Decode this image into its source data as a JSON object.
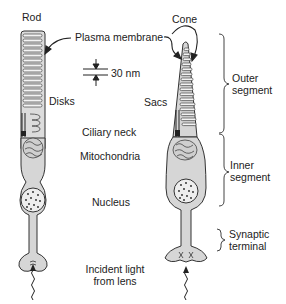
{
  "diagram": {
    "cells": {
      "rod": {
        "title": "Rod",
        "disks_label": "Disks"
      },
      "cone": {
        "title": "Cone",
        "sacs_label": "Sacs"
      }
    },
    "shared_labels": {
      "plasma_membrane": "Plasma membrane",
      "scale": "30 nm",
      "ciliary_neck": "Ciliary neck",
      "mitochondria": "Mitochondria",
      "nucleus": "Nucleus",
      "incident_light_line1": "Incident light",
      "incident_light_line2": "from lens"
    },
    "segments": {
      "outer_line1": "Outer",
      "outer_line2": "segment",
      "inner_line1": "Inner",
      "inner_line2": "segment",
      "synaptic_line1": "Synaptic",
      "synaptic_line2": "terminal"
    },
    "colors": {
      "cell_fill": "#d6d6d6",
      "outline": "#333333",
      "background": "#ffffff"
    }
  }
}
